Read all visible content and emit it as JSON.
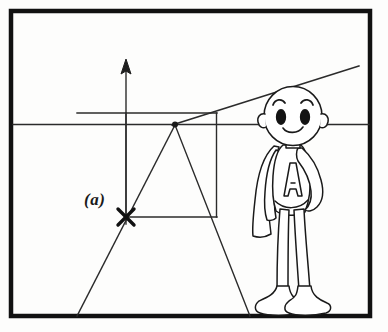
{
  "figure": {
    "caption_label": "(a)",
    "letter_on_chest": "A",
    "colors": {
      "ink": "#1a1a1a",
      "line": "#2b2b2b",
      "background": "#fdfdfc",
      "frame": "#111111",
      "eye_fill": "#141414"
    },
    "frame": {
      "x": 9,
      "y": 9,
      "width": 363,
      "height": 309,
      "thickness": 4
    },
    "geometry": {
      "horizon_line": {
        "y": 124,
        "x1": 11,
        "x2": 370,
        "label": "horizon-line"
      },
      "upper_guide_line": {
        "y": 113,
        "x1": 77,
        "x2": 217,
        "label": "upper-guide-line"
      },
      "vertical_axis": {
        "x": 126,
        "y_top": 60,
        "y_bottom": 225,
        "arrow": "up"
      },
      "vanishing_point": {
        "x": 175,
        "y": 124
      },
      "cross_mark": {
        "x": 126,
        "y": 217,
        "size": 13
      },
      "square": {
        "left": 126,
        "top": 113,
        "right": 217,
        "bottom": 217
      },
      "diagonal_to_upper_right": {
        "x1": 175,
        "y1": 124,
        "x2": 359,
        "y2": 66
      },
      "ray_down_left": {
        "x1": 175,
        "y1": 124,
        "x2": 77,
        "y2": 316
      },
      "ray_down_right": {
        "x1": 175,
        "y1": 124,
        "x2": 250,
        "y2": 316
      }
    },
    "character": {
      "name": "superhero-cartoon",
      "head_center": {
        "x": 293,
        "y": 117
      },
      "features": [
        "bald-head",
        "curved-eyebrows",
        "oval-eyes",
        "smile",
        "ears",
        "cape",
        "chest-letter",
        "hand-on-hip",
        "boots"
      ]
    }
  }
}
